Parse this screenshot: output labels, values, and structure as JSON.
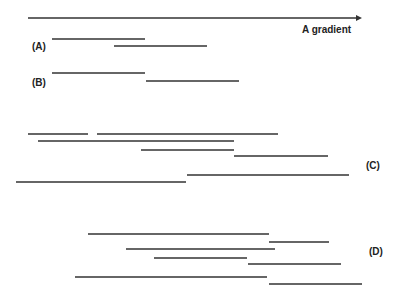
{
  "axis": {
    "label": "A gradient",
    "x1": 28,
    "x2": 362,
    "y": 18,
    "color": "#333333"
  },
  "line_color": "#333333",
  "panels": [
    {
      "label": "(A)",
      "label_x": 32,
      "label_y": 41,
      "segments": [
        {
          "x1": 52,
          "x2": 145,
          "y": 39
        },
        {
          "x1": 114,
          "x2": 207,
          "y": 46
        }
      ]
    },
    {
      "label": "(B)",
      "label_x": 32,
      "label_y": 77,
      "segments": [
        {
          "x1": 52,
          "x2": 145,
          "y": 73
        },
        {
          "x1": 146,
          "x2": 239,
          "y": 81
        }
      ]
    },
    {
      "label": "(C)",
      "label_x": 366,
      "label_y": 160,
      "segments": [
        {
          "x1": 28,
          "x2": 88,
          "y": 134
        },
        {
          "x1": 97,
          "x2": 278,
          "y": 134
        },
        {
          "x1": 38,
          "x2": 234,
          "y": 141
        },
        {
          "x1": 141,
          "x2": 234,
          "y": 150
        },
        {
          "x1": 234,
          "x2": 328,
          "y": 156
        },
        {
          "x1": 187,
          "x2": 349,
          "y": 175
        },
        {
          "x1": 16,
          "x2": 186,
          "y": 182
        }
      ]
    },
    {
      "label": "(D)",
      "label_x": 369,
      "label_y": 246,
      "segments": [
        {
          "x1": 88,
          "x2": 269,
          "y": 234
        },
        {
          "x1": 269,
          "x2": 329,
          "y": 242
        },
        {
          "x1": 126,
          "x2": 275,
          "y": 249
        },
        {
          "x1": 154,
          "x2": 247,
          "y": 258
        },
        {
          "x1": 248,
          "x2": 341,
          "y": 264
        },
        {
          "x1": 75,
          "x2": 267,
          "y": 277
        },
        {
          "x1": 269,
          "x2": 362,
          "y": 284
        }
      ]
    }
  ]
}
